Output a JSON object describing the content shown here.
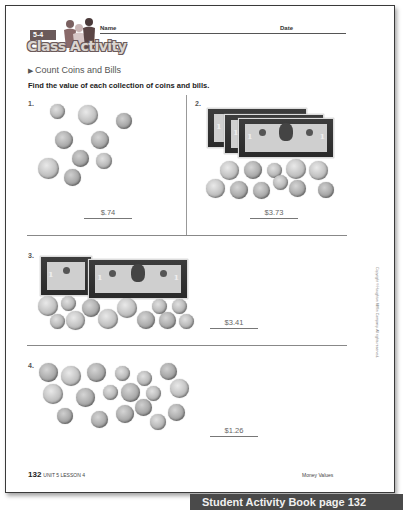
{
  "header": {
    "lesson_badge": "5-4",
    "brand": "Class Activity",
    "name_label": "Name",
    "date_label": "Date"
  },
  "section": {
    "title": "Count Coins and Bills",
    "instructions": "Find the value of each collection of coins and bills."
  },
  "problems": [
    {
      "number": "1.",
      "answer": "$.74",
      "bills": 0,
      "coins": 9
    },
    {
      "number": "2.",
      "answer": "$3.73",
      "bills": 3,
      "coins": 11
    },
    {
      "number": "3.",
      "answer": "$3.41",
      "bills": 2,
      "coins": 13
    },
    {
      "number": "4.",
      "answer": "$1.26",
      "bills": 0,
      "coins": 20
    }
  ],
  "footer": {
    "page_number": "132",
    "unit_lesson": "UNIT 5 LESSON 4",
    "topic": "Money Values",
    "copyright": "Copyright © Houghton Mifflin Company. All rights reserved."
  },
  "caption": {
    "label": "Student Activity Book page 132"
  },
  "colors": {
    "badge": "#6b5a5a",
    "caption_bg": "#4a4a4a",
    "border": "#3a3a3a"
  }
}
